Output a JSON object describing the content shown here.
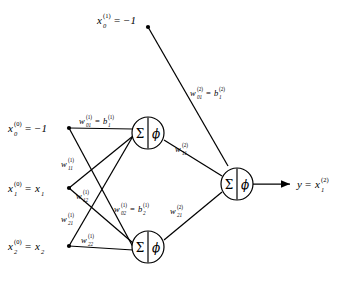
{
  "figure": {
    "kind": "neural-network-diagram",
    "stroke_color": "#000000",
    "background_color": "#ffffff"
  },
  "nodes": {
    "bias_layer1": {
      "base": "x",
      "sub": "0",
      "sup": "(1)",
      "eq": "=",
      "value": "−1",
      "full": "x_0^(1) = -1"
    },
    "input_bias": {
      "base": "x",
      "sub": "0",
      "sup": "(0)",
      "eq": "=",
      "value": "−1",
      "full": "x_0^(0) = -1"
    },
    "input_1": {
      "base": "x",
      "sub": "1",
      "sup": "(0)",
      "eq": "=",
      "value": "x",
      "value_sub": "1",
      "full": "x_1^(0) = x_1"
    },
    "input_2": {
      "base": "x",
      "sub": "2",
      "sup": "(0)",
      "eq": "=",
      "value": "x",
      "value_sub": "2",
      "full": "x_2^(0) = x_2"
    },
    "output": {
      "base": "y",
      "eq": "=",
      "value": "x",
      "value_sub": "1",
      "value_sup": "(2)",
      "full": "y = x_1^(2)"
    }
  },
  "neurons": {
    "sum_symbol": "Σ",
    "activation_symbol": "ϕ",
    "hidden_1": {
      "label": "hidden-neuron-1"
    },
    "hidden_2": {
      "label": "hidden-neuron-2"
    },
    "output": {
      "label": "output-neuron"
    }
  },
  "weights": [
    {
      "id": "w01_1",
      "base": "w",
      "sub": "01",
      "sup": "(1)",
      "eq": "=",
      "rhs_base": "b",
      "rhs_sub": "1",
      "rhs_sup": "(1)",
      "full": "w_01^(1) = b_1^(1)"
    },
    {
      "id": "w11_1",
      "base": "w",
      "sub": "11",
      "sup": "(1)",
      "full": "w_11^(1)"
    },
    {
      "id": "w12_1",
      "base": "w",
      "sub": "12",
      "sup": "(1)",
      "full": "w_12^(1)"
    },
    {
      "id": "w21_1",
      "base": "w",
      "sub": "21",
      "sup": "(1)",
      "full": "w_21^(1)"
    },
    {
      "id": "w22_1",
      "base": "w",
      "sub": "22",
      "sup": "(1)",
      "full": "w_22^(1)"
    },
    {
      "id": "w02_1",
      "base": "w",
      "sub": "02",
      "sup": "(1)",
      "eq": "=",
      "rhs_base": "b",
      "rhs_sub": "2",
      "rhs_sup": "(1)",
      "full": "w_02^(1) = b_2^(1)"
    },
    {
      "id": "w01_2",
      "base": "w",
      "sub": "01",
      "sup": "(2)",
      "eq": "=",
      "rhs_base": "b",
      "rhs_sub": "1",
      "rhs_sup": "(2)",
      "full": "w_01^(2) = b_1^(2)"
    },
    {
      "id": "w11_2",
      "base": "w",
      "sub": "11",
      "sup": "(2)",
      "full": "w_11^(2)"
    },
    {
      "id": "w21_2",
      "base": "w",
      "sub": "21",
      "sup": "(2)",
      "full": "w_21^(2)"
    }
  ]
}
